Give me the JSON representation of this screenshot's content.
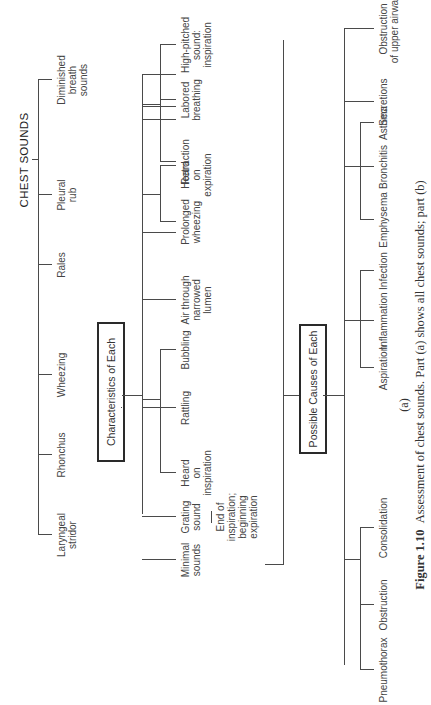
{
  "diagram": {
    "title": "CHEST SOUNDS",
    "sounds": [
      {
        "label": "Laryngeal\nstridor"
      },
      {
        "label": "Rhonchus"
      },
      {
        "label": "Wheezing"
      },
      {
        "label": "Rales"
      },
      {
        "label": "Pleural\nrub"
      },
      {
        "label": "Diminished\nbreath\nsounds"
      }
    ],
    "characteristics_box": "Characteristics of Each",
    "characteristics": [
      {
        "label": "High-pitched\nsound:\ninspiration"
      },
      {
        "label": "Labored\nbreathing"
      },
      {
        "label": "Retraction"
      },
      {
        "label": "Prolonged\nwheezing"
      },
      {
        "label": "Heard\non\nexpiration"
      },
      {
        "label": "Air through\nnarrowed\nlumen"
      },
      {
        "label": "Bubbling"
      },
      {
        "label": "Rattling"
      },
      {
        "label": "Heard\non\ninspiration"
      },
      {
        "label": "Grating\nsound"
      },
      {
        "label": "Minimal\nsounds"
      }
    ],
    "grating_note": "End of\ninspiration;\nbeginning\nexpiration",
    "causes_box": "Possible Causes of Each",
    "causes": [
      {
        "label": "Obstruction\nof upper airway"
      },
      {
        "label": "Secretions"
      },
      {
        "label": "Asthma"
      },
      {
        "label": "Bronchitis"
      },
      {
        "label": "Emphysema"
      },
      {
        "label": "Infection"
      },
      {
        "label": "Inflammation"
      },
      {
        "label": "Aspiration"
      },
      {
        "label": "Consolidation"
      },
      {
        "label": "Obstruction"
      },
      {
        "label": "Pneumothorax"
      }
    ],
    "part_label": "(a)",
    "caption_bold": "Figure 1.10",
    "caption_text": "Assessment of chest sounds. Part (a) shows all chest sounds; part (b)"
  }
}
